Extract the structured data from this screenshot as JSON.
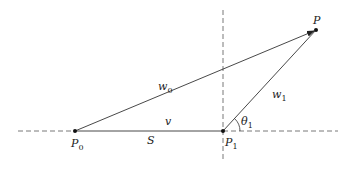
{
  "diagram": {
    "points": {
      "P0": {
        "label": "P",
        "sub": "0",
        "x": 75,
        "y": 131
      },
      "P1": {
        "label": "P",
        "sub": "1",
        "x": 223,
        "y": 131
      },
      "P": {
        "label": "P",
        "sub": "",
        "x": 316,
        "y": 30
      }
    },
    "edges": {
      "v": {
        "label": "v",
        "from": "P0",
        "to": "P1"
      },
      "w0": {
        "label": "w",
        "sub": "0",
        "from": "P0",
        "to": "P"
      },
      "w1": {
        "label": "w",
        "sub": "1",
        "from": "P1",
        "to": "P"
      }
    },
    "labels": {
      "S": "S",
      "theta": "θ",
      "theta_sub": "1"
    },
    "colors": {
      "line": "#333333",
      "dash": "#555555",
      "point": "#111111"
    }
  }
}
